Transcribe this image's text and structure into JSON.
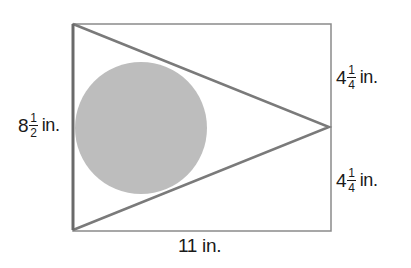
{
  "diagram": {
    "colors": {
      "rectangle_stroke": "#8a8a8a",
      "triangle_stroke": "#7a7a7a",
      "circle_fill": "#bdbdbd",
      "text": "#1a1a1a"
    },
    "rectangle": {
      "x": 73,
      "y": 24,
      "width": 258,
      "height": 207
    },
    "triangle": {
      "points": "73,24 329,127 73,230"
    },
    "circle": {
      "cx": 141,
      "cy": 128,
      "r": 66
    },
    "labels": {
      "left": {
        "whole": "8",
        "num": "1",
        "den": "2",
        "unit": "in."
      },
      "right_top": {
        "whole": "4",
        "num": "1",
        "den": "4",
        "unit": "in."
      },
      "right_bottom": {
        "whole": "4",
        "num": "1",
        "den": "4",
        "unit": "in."
      },
      "bottom": {
        "text": "11 in."
      }
    }
  }
}
